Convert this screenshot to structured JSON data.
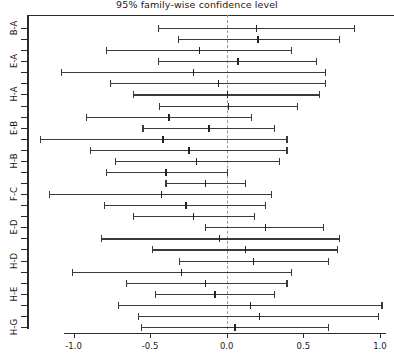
{
  "chart_data": {
    "type": "errorbar",
    "title": "95% family-wise confidence level",
    "subtitle": "",
    "xlabel": "",
    "ylabel": "",
    "xlim": [
      -1.31,
      1.14
    ],
    "ylim": [
      0,
      29
    ],
    "grid": false,
    "legend": null,
    "zero_reference": 0.0,
    "xticks": [
      -1.0,
      -0.5,
      0.0,
      0.5,
      1.0
    ],
    "xticklabels": [
      "-1.0",
      "-0.5",
      "0.0",
      "0.5",
      "1.0"
    ],
    "yticklabels_shown": [
      "B-A",
      "E-A",
      "H-A",
      "E-B",
      "H-B",
      "F-C",
      "E-D",
      "H-D",
      "H-E",
      "H-G"
    ],
    "categories": [
      "B-A",
      "C-A",
      "D-A",
      "E-A",
      "F-A",
      "G-A",
      "H-A",
      "C-B",
      "D-B",
      "E-B",
      "F-B",
      "G-B",
      "H-B",
      "D-C",
      "E-C",
      "F-C",
      "G-C",
      "H-C",
      "E-D",
      "F-D",
      "G-D",
      "H-D",
      "F-E",
      "G-E",
      "H-E",
      "G-F",
      "H-F",
      "H-G"
    ],
    "series": [
      {
        "name": "Tukey HSD difference of means",
        "points": [
          {
            "label": "B-A",
            "lower": -0.45,
            "center": 0.19,
            "upper": 0.83
          },
          {
            "label": "C-A",
            "lower": -0.32,
            "center": 0.2,
            "upper": 0.73
          },
          {
            "label": "D-A",
            "lower": -0.79,
            "center": -0.18,
            "upper": 0.42
          },
          {
            "label": "E-A",
            "lower": -0.45,
            "center": 0.07,
            "upper": 0.58
          },
          {
            "label": "F-A",
            "lower": -1.08,
            "center": -0.22,
            "upper": 0.64
          },
          {
            "label": "G-A",
            "lower": -0.76,
            "center": -0.06,
            "upper": 0.64
          },
          {
            "label": "H-A",
            "lower": -0.61,
            "center": 0.0,
            "upper": 0.6
          },
          {
            "label": "C-B",
            "lower": -0.44,
            "center": 0.01,
            "upper": 0.46
          },
          {
            "label": "D-B",
            "lower": -0.92,
            "center": -0.38,
            "upper": 0.16
          },
          {
            "label": "E-B",
            "lower": -0.55,
            "center": -0.12,
            "upper": 0.31
          },
          {
            "label": "F-B",
            "lower": -1.22,
            "center": -0.42,
            "upper": 0.39
          },
          {
            "label": "G-B",
            "lower": -0.89,
            "center": -0.25,
            "upper": 0.39
          },
          {
            "label": "H-B",
            "lower": -0.73,
            "center": -0.2,
            "upper": 0.34
          },
          {
            "label": "D-C",
            "lower": -0.79,
            "center": -0.4,
            "upper": 0.0
          },
          {
            "label": "E-C",
            "lower": -0.4,
            "center": -0.14,
            "upper": 0.12
          },
          {
            "label": "F-C",
            "lower": -1.16,
            "center": -0.43,
            "upper": 0.29
          },
          {
            "label": "G-C",
            "lower": -0.8,
            "center": -0.27,
            "upper": 0.25
          },
          {
            "label": "H-C",
            "lower": -0.61,
            "center": -0.22,
            "upper": 0.18
          },
          {
            "label": "E-D",
            "lower": -0.14,
            "center": 0.25,
            "upper": 0.63
          },
          {
            "label": "F-D",
            "lower": -0.82,
            "center": -0.05,
            "upper": 0.73
          },
          {
            "label": "G-D",
            "lower": -0.49,
            "center": 0.12,
            "upper": 0.72
          },
          {
            "label": "H-D",
            "lower": -0.31,
            "center": 0.17,
            "upper": 0.66
          },
          {
            "label": "F-E",
            "lower": -1.01,
            "center": -0.3,
            "upper": 0.42
          },
          {
            "label": "G-E",
            "lower": -0.66,
            "center": -0.14,
            "upper": 0.39
          },
          {
            "label": "H-E",
            "lower": -0.47,
            "center": -0.08,
            "upper": 0.31
          },
          {
            "label": "G-F",
            "lower": -0.71,
            "center": 0.15,
            "upper": 1.01
          },
          {
            "label": "H-F",
            "lower": -0.58,
            "center": 0.21,
            "upper": 0.99
          },
          {
            "label": "H-G",
            "lower": -0.56,
            "center": 0.05,
            "upper": 0.66
          }
        ]
      }
    ],
    "colors": {
      "axis": "#2b2b2b",
      "interval": "#3a3a3a",
      "zero_line": "#9a9a9a",
      "background": "#ffffff",
      "text": "#1a1a1a"
    }
  }
}
